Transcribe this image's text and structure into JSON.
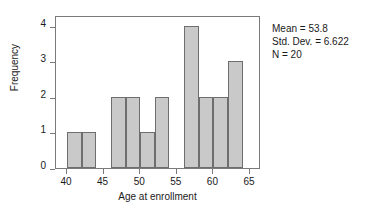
{
  "chart_data": {
    "type": "bar",
    "title": "",
    "xlabel": "Age at enrollment",
    "ylabel": "Frequency",
    "xlim": [
      38.5,
      66.5
    ],
    "ylim": [
      0,
      4.3
    ],
    "grid": false,
    "legend": null,
    "bin_width": 2,
    "bins": [
      {
        "x0": 40,
        "x1": 42,
        "center": 41,
        "value": 1
      },
      {
        "x0": 42,
        "x1": 44,
        "center": 43,
        "value": 1
      },
      {
        "x0": 46,
        "x1": 48,
        "center": 47,
        "value": 2
      },
      {
        "x0": 48,
        "x1": 50,
        "center": 49,
        "value": 2
      },
      {
        "x0": 50,
        "x1": 52,
        "center": 51,
        "value": 1
      },
      {
        "x0": 52,
        "x1": 54,
        "center": 53,
        "value": 2
      },
      {
        "x0": 56,
        "x1": 58,
        "center": 57,
        "value": 4
      },
      {
        "x0": 58,
        "x1": 60,
        "center": 59,
        "value": 2
      },
      {
        "x0": 60,
        "x1": 62,
        "center": 61,
        "value": 2
      },
      {
        "x0": 62,
        "x1": 64,
        "center": 63,
        "value": 3
      }
    ],
    "categories": [
      "40-42",
      "42-44",
      "46-48",
      "48-50",
      "50-52",
      "52-54",
      "56-58",
      "58-60",
      "60-62",
      "62-64"
    ],
    "values": [
      1,
      1,
      2,
      2,
      1,
      2,
      4,
      2,
      2,
      3
    ],
    "xticks": [
      {
        "value": 40,
        "label": "40"
      },
      {
        "value": 45,
        "label": "45"
      },
      {
        "value": 50,
        "label": "50"
      },
      {
        "value": 55,
        "label": "55"
      },
      {
        "value": 60,
        "label": "60"
      },
      {
        "value": 65,
        "label": "65"
      }
    ],
    "yticks": [
      {
        "value": 0,
        "label": "0"
      },
      {
        "value": 1,
        "label": "1"
      },
      {
        "value": 2,
        "label": "2"
      },
      {
        "value": 3,
        "label": "3"
      },
      {
        "value": 4,
        "label": "4"
      }
    ],
    "annotations": [
      "Mean = 53.8",
      "Std. Dev. = 6.622",
      "N = 20"
    ],
    "colors": {
      "bar_fill": "#c9c9c9",
      "bar_edge": "#6e6e6e",
      "frame": "#7a7a7a",
      "text": "#1a1a1a",
      "background": "#ffffff"
    }
  },
  "stats": {
    "mean_line": "Mean = 53.8",
    "stddev_line": "Std. Dev. = 6.622",
    "n_line": "N = 20"
  },
  "axes": {
    "x_title": "Age at enrollment",
    "y_title": "Frequency"
  }
}
